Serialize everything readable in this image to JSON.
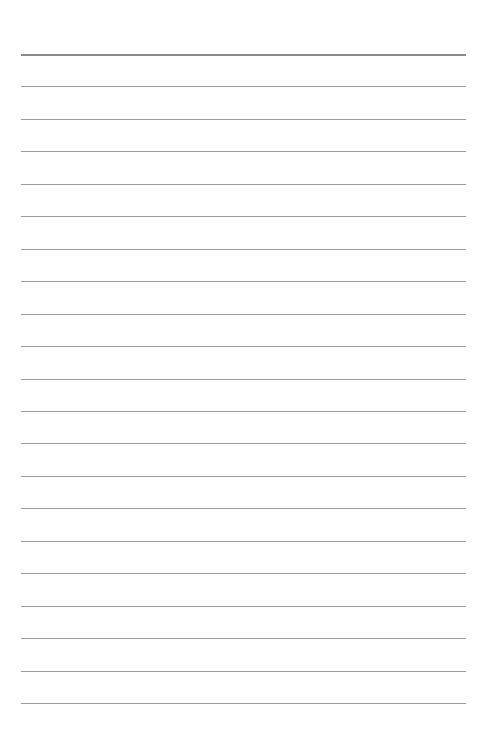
{
  "page": {
    "type": "lined-paper",
    "background": "#ffffff",
    "line_color": "#9a9a9a",
    "line_count": 21,
    "first_line_y": 54,
    "line_spacing": 32.45,
    "line_left": 21,
    "line_width": 445
  }
}
